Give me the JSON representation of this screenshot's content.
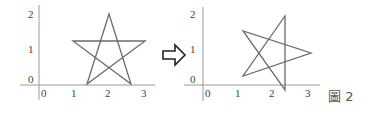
{
  "figure": {
    "caption": "圖 2",
    "arrow": "transformation-arrow",
    "colors": {
      "star": "#6b6b6b",
      "axis": "#9a9a9a",
      "text": "#444444"
    }
  },
  "left_plot": {
    "x_ticks": [
      "0",
      "1",
      "2",
      "3"
    ],
    "y_ticks": [
      "0",
      "1",
      "2"
    ],
    "star_vertices": [
      [
        2,
        2
      ],
      [
        1,
        1.2
      ],
      [
        3,
        1.2
      ],
      [
        1.4,
        0
      ],
      [
        2.7,
        0
      ]
    ]
  },
  "right_plot": {
    "x_ticks": [
      "0",
      "1",
      "2",
      "3"
    ],
    "y_ticks": [
      "0",
      "1",
      "2"
    ],
    "star_vertices": [
      [
        2.4,
        1.9
      ],
      [
        2.4,
        -0.1
      ],
      [
        1.15,
        1.5
      ],
      [
        1.15,
        0.25
      ],
      [
        3.1,
        0.9
      ]
    ]
  }
}
